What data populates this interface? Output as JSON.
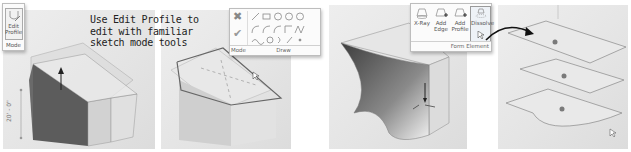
{
  "caption": {
    "lines": [
      "Use Edit Profile to",
      "edit with familiar",
      "sketch mode tools"
    ]
  },
  "panel1": {
    "ribbon": {
      "button_label_1": "Edit",
      "button_label_2": "Profile",
      "group_label": "Mode"
    },
    "dimension_label": "20' - 0\""
  },
  "panel2": {
    "ribbon": {
      "mode_label": "Mode",
      "draw_label": "Draw",
      "cancel_icon": "✖",
      "finish_icon": "✔"
    }
  },
  "panel3": {
    "ribbon": {
      "buttons": [
        {
          "label": "X-Ray"
        },
        {
          "label_1": "Add",
          "label_2": "Edge"
        },
        {
          "label_1": "Add",
          "label_2": "Profile"
        },
        {
          "label": "Dissolve"
        }
      ],
      "group_label": "Form Element"
    }
  },
  "colors": {
    "panel_bg": "#e6e6e6",
    "solid_dark": "#5a5a5a",
    "solid_light": "#d8d8d8",
    "edge": "#8a8a8a",
    "dot": "#7a7a7a"
  }
}
